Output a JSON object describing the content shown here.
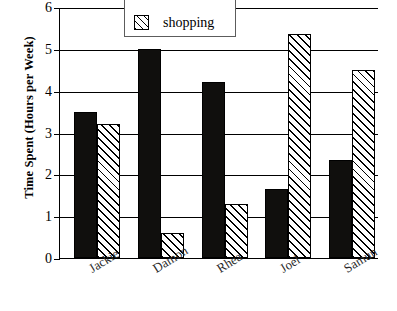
{
  "chart_data": {
    "type": "bar",
    "title": "",
    "xlabel": "",
    "ylabel": "Time Spent (Hours per Week)",
    "categories": [
      "Jackie",
      "Damon",
      "Rhea",
      "Joel",
      "Samun"
    ],
    "series": [
      {
        "name": "reading",
        "style": "solid",
        "values": [
          3.5,
          5.0,
          4.2,
          1.65,
          2.35
        ]
      },
      {
        "name": "shopping",
        "style": "hatch",
        "values": [
          3.2,
          0.6,
          1.3,
          5.35,
          4.5
        ]
      }
    ],
    "ylim": [
      0,
      6
    ],
    "yticks": [
      "0",
      "1",
      "2",
      "3",
      "4",
      "5",
      "6"
    ],
    "grid": true,
    "grid_axis": "y",
    "legend_position": "top-left",
    "legend_entries": [
      {
        "label": "shopping",
        "swatch": "hatched"
      }
    ]
  },
  "colors": {
    "solid_fill": "#100f0d",
    "hatch_fill": "#ffffff",
    "line": "#000000",
    "label": "#2b2b2b",
    "background": "#ffffff"
  }
}
